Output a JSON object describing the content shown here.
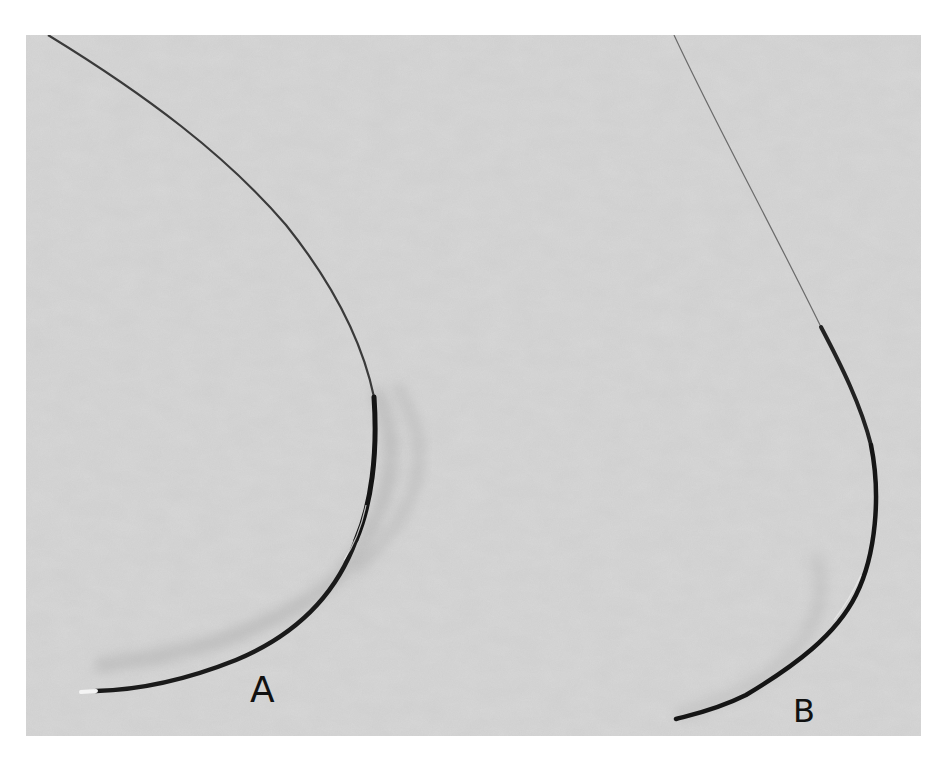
{
  "figure": {
    "background_color": "#d9d9d9",
    "page_color": "#ffffff",
    "needle_color": "#1a1a1a",
    "thread_color": "#3a3a3a",
    "labels": {
      "a": "A",
      "b": "B"
    },
    "objects": [
      {
        "id": "needle-a",
        "label": "A",
        "shape": "curved needle with swaged thread, wide curvature"
      },
      {
        "id": "needle-b",
        "label": "B",
        "shape": "curved needle with swaged thread, narrow J-shaped curvature"
      }
    ]
  }
}
